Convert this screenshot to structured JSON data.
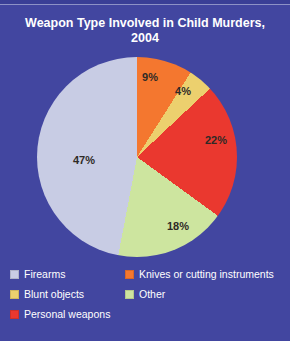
{
  "title": {
    "line1": "Weapon Type Involved in Child Murders,",
    "line2": "2004"
  },
  "chart_data": {
    "type": "pie",
    "title": "Weapon Type Involved in Child Murders, 2004",
    "unit": "percent",
    "direction": "clockwise",
    "start_angle_deg": 0,
    "slices": [
      {
        "label": "Knives or cutting instruments",
        "value": 9,
        "display": "9%",
        "color": "#f4772f"
      },
      {
        "label": "Blunt objects",
        "value": 4,
        "display": "4%",
        "color": "#ecd06e"
      },
      {
        "label": "Personal weapons",
        "value": 22,
        "display": "22%",
        "color": "#ea382f"
      },
      {
        "label": "Other",
        "value": 18,
        "display": "18%",
        "color": "#cde59f"
      },
      {
        "label": "Firearms",
        "value": 47,
        "display": "47%",
        "color": "#c8cce4"
      }
    ],
    "layout": {
      "center_px": [
        137,
        157
      ],
      "radius_px": 100,
      "label_positions_px": [
        [
          150,
          77
        ],
        [
          183,
          91
        ],
        [
          216,
          140
        ],
        [
          178,
          226
        ],
        [
          84,
          160
        ]
      ],
      "legend_position": "bottom-two-columns",
      "background": "#4246a0"
    }
  },
  "legend": {
    "items": [
      {
        "label": "Firearms",
        "color": "#c8cce4"
      },
      {
        "label": "Knives or cutting instruments",
        "color": "#f4772f"
      },
      {
        "label": "Blunt objects",
        "color": "#ecd06e"
      },
      {
        "label": "Other",
        "color": "#cde59f"
      },
      {
        "label": "Personal weapons",
        "color": "#ea382f"
      }
    ]
  }
}
